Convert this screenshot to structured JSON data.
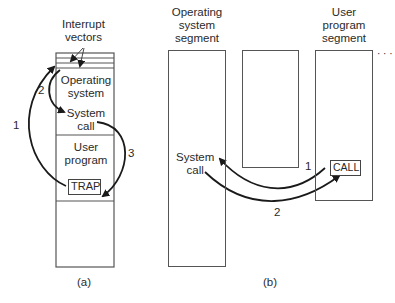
{
  "figure_a": {
    "caption": "(a)",
    "interrupt_vectors_label_line1": "Interrupt",
    "interrupt_vectors_label_line2": "vectors",
    "os_label_line1": "Operating",
    "os_label_line2": "system",
    "system_call_line1": "System",
    "system_call_line2": "call",
    "user_program_line1": "User",
    "user_program_line2": "program",
    "trap_label": "TRAP",
    "arrow_labels": [
      "1",
      "2",
      "3"
    ]
  },
  "figure_b": {
    "caption": "(b)",
    "os_segment_line1": "Operating",
    "os_segment_line2": "system",
    "os_segment_line3": "segment",
    "user_segment_line1": "User",
    "user_segment_line2": "program",
    "user_segment_line3": "segment",
    "ellipsis": "· · ·",
    "system_call_line1": "System",
    "system_call_line2": "call",
    "call_label": "CALL",
    "arrow_labels": [
      "1",
      "2"
    ]
  },
  "colors": {
    "line": "#555555",
    "arrow": "#1a1a1a",
    "text": "#2a2a2a"
  }
}
